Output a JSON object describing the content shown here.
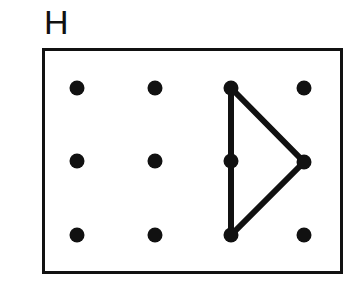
{
  "figure": {
    "label": "H",
    "background_color": "#ffffff",
    "ink_color": "#111111",
    "frame": {
      "name": "bounding-rectangle",
      "x": 42,
      "y": 48,
      "width": 301,
      "height": 226,
      "stroke_width": 3,
      "stroke_color": "#111111",
      "fill": "#ffffff"
    },
    "dot_grid": {
      "rows": 3,
      "columns": 4,
      "dot_radius": 7.5,
      "dot_color": "#111111",
      "column_x": [
        77,
        155,
        231,
        304
      ],
      "row_y": [
        88,
        161,
        235
      ],
      "dots": [
        {
          "id": "dot-r1c1",
          "row": 1,
          "col": 1,
          "cx": 77,
          "cy": 88,
          "label": "top-left"
        },
        {
          "id": "dot-r1c2",
          "row": 1,
          "col": 2,
          "cx": 155,
          "cy": 88,
          "label": "top-inner-left"
        },
        {
          "id": "dot-r1c3",
          "row": 1,
          "col": 3,
          "cx": 231,
          "cy": 88,
          "label": "top-inner-right"
        },
        {
          "id": "dot-r1c4",
          "row": 1,
          "col": 4,
          "cx": 304,
          "cy": 88,
          "label": "top-right"
        },
        {
          "id": "dot-r2c1",
          "row": 2,
          "col": 1,
          "cx": 77,
          "cy": 161,
          "label": "middle-left"
        },
        {
          "id": "dot-r2c2",
          "row": 2,
          "col": 2,
          "cx": 155,
          "cy": 161,
          "label": "middle-inner-left"
        },
        {
          "id": "dot-r2c3",
          "row": 2,
          "col": 3,
          "cx": 231,
          "cy": 161,
          "label": "middle-inner-right"
        },
        {
          "id": "dot-r2c4",
          "row": 2,
          "col": 4,
          "cx": 304,
          "cy": 162,
          "label": "middle-right"
        },
        {
          "id": "dot-r3c1",
          "row": 3,
          "col": 1,
          "cx": 77,
          "cy": 235,
          "label": "bottom-left"
        },
        {
          "id": "dot-r3c2",
          "row": 3,
          "col": 2,
          "cx": 155,
          "cy": 235,
          "label": "bottom-inner-left"
        },
        {
          "id": "dot-r3c3",
          "row": 3,
          "col": 3,
          "cx": 231,
          "cy": 235,
          "label": "bottom-inner-right"
        },
        {
          "id": "dot-r3c4",
          "row": 3,
          "col": 4,
          "cx": 304,
          "cy": 235,
          "label": "bottom-right"
        }
      ]
    },
    "shape": {
      "name": "triangle",
      "stroke_width": 6,
      "stroke_color": "#111111",
      "fill": "none",
      "vertices": [
        "dot-r1c3",
        "dot-r2c4",
        "dot-r3c3"
      ],
      "points": "231,88 304,162 231,235",
      "edges": [
        {
          "id": "edge-top-diagonal",
          "from": "dot-r1c3",
          "to": "dot-r2c4",
          "x1": 231,
          "y1": 88,
          "x2": 304,
          "y2": 162
        },
        {
          "id": "edge-bottom-diagonal",
          "from": "dot-r2c4",
          "to": "dot-r3c3",
          "x1": 304,
          "y1": 162,
          "x2": 231,
          "y2": 235
        },
        {
          "id": "edge-vertical",
          "from": "dot-r3c3",
          "to": "dot-r1c3",
          "x1": 231,
          "y1": 235,
          "x2": 231,
          "y2": 88
        }
      ]
    }
  }
}
